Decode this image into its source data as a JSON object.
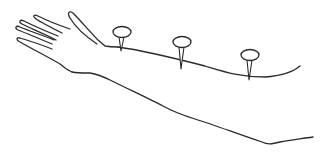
{
  "illustration": {
    "subject": "arm with three acupuncture needles",
    "background": "#ffffff",
    "line_color": "#2a2a2a",
    "needles": [
      {
        "label": "needle-1",
        "head": {
          "cx": 122,
          "cy": 32,
          "rx": 9,
          "ry": 5.5
        },
        "tip": {
          "x": 121,
          "y": 50
        }
      },
      {
        "label": "needle-2",
        "head": {
          "cx": 182,
          "cy": 42,
          "rx": 9,
          "ry": 5.5
        },
        "tip": {
          "x": 181,
          "y": 68
        }
      },
      {
        "label": "needle-3",
        "head": {
          "cx": 250,
          "cy": 55,
          "rx": 9,
          "ry": 5.5
        },
        "tip": {
          "x": 249,
          "y": 79
        }
      }
    ]
  }
}
